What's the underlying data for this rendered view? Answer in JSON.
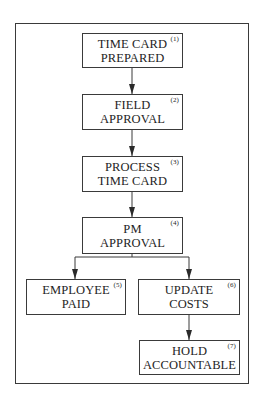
{
  "diagram": {
    "type": "flowchart",
    "nodes": [
      {
        "id": 1,
        "number": "(1)",
        "lines": [
          "TIME CARD",
          "PREPARED"
        ]
      },
      {
        "id": 2,
        "number": "(2)",
        "lines": [
          "FIELD",
          "APPROVAL"
        ]
      },
      {
        "id": 3,
        "number": "(3)",
        "lines": [
          "PROCESS",
          "TIME CARD"
        ]
      },
      {
        "id": 4,
        "number": "(4)",
        "lines": [
          "PM",
          "APPROVAL"
        ]
      },
      {
        "id": 5,
        "number": "(5)",
        "lines": [
          "EMPLOYEE",
          "PAID"
        ]
      },
      {
        "id": 6,
        "number": "(6)",
        "lines": [
          "UPDATE",
          "COSTS"
        ]
      },
      {
        "id": 7,
        "number": "(7)",
        "lines": [
          "HOLD",
          "ACCOUNTABLE"
        ]
      }
    ],
    "edges": [
      {
        "from": 1,
        "to": 2
      },
      {
        "from": 2,
        "to": 3
      },
      {
        "from": 3,
        "to": 4
      },
      {
        "from": 4,
        "to": 5
      },
      {
        "from": 4,
        "to": 6
      },
      {
        "from": 6,
        "to": 7
      }
    ],
    "colors": {
      "line": "#3a3a3a",
      "text": "#1e1e1e",
      "background": "#ffffff"
    }
  }
}
